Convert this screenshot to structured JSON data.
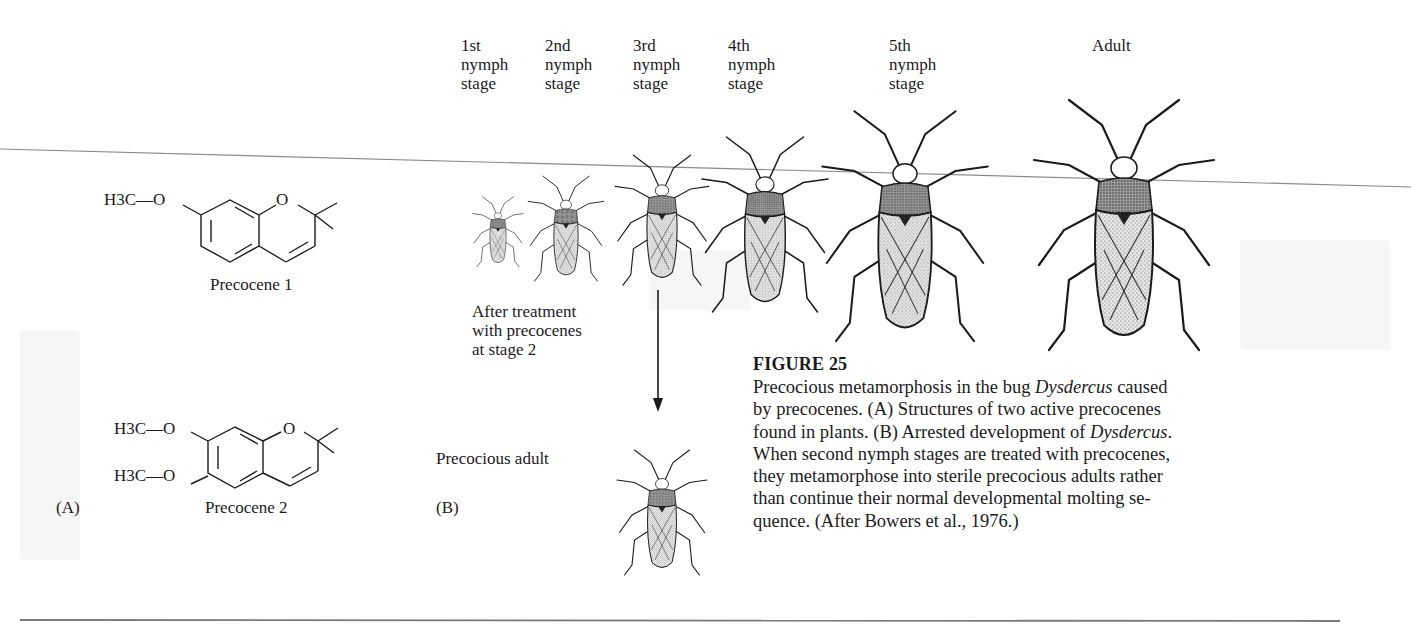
{
  "figure": {
    "number_label": "FIGURE 25",
    "caption_parts": [
      {
        "text": "Precocious metamorphosis in the bug ",
        "italic": false
      },
      {
        "text": "Dysdercus",
        "italic": true
      },
      {
        "text": " caused by precocenes. (A) Structures of two active precocenes found in plants. (B) Arrested development of ",
        "italic": false
      },
      {
        "text": "Dysdercus",
        "italic": true
      },
      {
        "text": ". When second nymph stages are treated with precocenes, they metamorphose into sterile precocious adults rather than continue their normal developmental molting se-quence. (After Bowers et al., 1976.)",
        "italic": false
      }
    ],
    "caption_lines": [
      "Precocious metamorphosis in the bug Dysdercus caused",
      "by precocenes. (A) Structures of two active precocenes",
      "found in plants. (B) Arrested development of Dysdercus.",
      "When second nymph stages are treated with precocenes,",
      "they metamorphose into sterile precocious adults rather",
      "than continue their normal developmental molting se-",
      "quence. (After Bowers et al., 1976.)"
    ]
  },
  "panel_a": {
    "label": "(A)",
    "compounds": [
      {
        "name": "Precocene 1",
        "substituents": [
          "H3C—O"
        ]
      },
      {
        "name": "Precocene 2",
        "substituents": [
          "H3C—O",
          "H3C—O"
        ]
      }
    ],
    "ring_heteroatom": "O"
  },
  "panel_b": {
    "label": "(B)",
    "stages": [
      {
        "lines": [
          "1st",
          "nymph",
          "stage"
        ]
      },
      {
        "lines": [
          "2nd",
          "nymph",
          "stage"
        ]
      },
      {
        "lines": [
          "3rd",
          "nymph",
          "stage"
        ]
      },
      {
        "lines": [
          "4th",
          "nymph",
          "stage"
        ]
      },
      {
        "lines": [
          "5th",
          "nymph",
          "stage"
        ]
      },
      {
        "lines": [
          "Adult"
        ]
      }
    ],
    "treatment_note": [
      "After treatment",
      "with precocenes",
      "at stage 2"
    ],
    "result_label": "Precocious adult"
  }
}
